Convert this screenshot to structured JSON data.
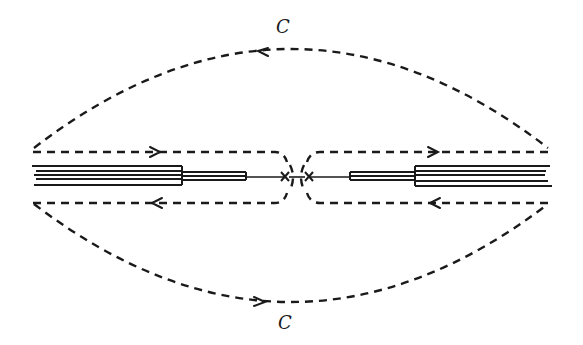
{
  "diagram": {
    "type": "contour-integration-with-branch-cuts",
    "labels": {
      "top_contour": "C",
      "bottom_contour": "C"
    },
    "elements": {
      "outer_contour": "dashed closed contour C, upper arc traversed right-to-left, lower arc traversed left-to-right",
      "left_branch_cut": "multi-line branch cut on left real axis",
      "right_branch_cut": "multi-line branch cut on right real axis",
      "branch_points": [
        "left branch point (x)",
        "right branch point (x)"
      ],
      "keyhole_paths": "dashed paths above (rightward arrows) and below (leftward arrows) each cut, joined by small arcs around branch points"
    },
    "colors": {
      "ink": "#1a1a1a",
      "background": "#ffffff"
    }
  }
}
